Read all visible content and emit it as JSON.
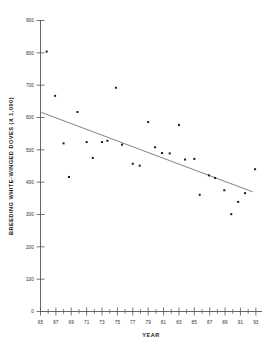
{
  "chart_data": {
    "type": "scatter",
    "title": "",
    "xlabel": "YEAR",
    "ylabel": "BREEDING WHITE-WINGED DOVES (X 1,000)",
    "xlim": [
      65,
      93.8
    ],
    "ylim": [
      0,
      900
    ],
    "grid": false,
    "legend": null,
    "x_tick_labels": [
      "65",
      "67",
      "69",
      "71",
      "73",
      "75",
      "77",
      "79",
      "81",
      "83",
      "85",
      "87",
      "89",
      "91",
      "93"
    ],
    "x_tick_values": [
      65,
      67,
      69,
      71,
      73,
      75,
      77,
      79,
      81,
      83,
      85,
      87,
      89,
      91,
      93
    ],
    "x_minor_tick_values": [
      66,
      68,
      70,
      72,
      74,
      76,
      78,
      80,
      82,
      84,
      86,
      88,
      90,
      92
    ],
    "y_tick_labels": [
      "0",
      "100",
      "200",
      "300",
      "400",
      "500",
      "600",
      "700",
      "800",
      "900"
    ],
    "y_tick_values": [
      0,
      100,
      200,
      300,
      400,
      500,
      600,
      700,
      800,
      900
    ],
    "points": [
      {
        "x": 65.8,
        "y": 804
      },
      {
        "x": 66.9,
        "y": 667
      },
      {
        "x": 68.0,
        "y": 520
      },
      {
        "x": 68.7,
        "y": 416
      },
      {
        "x": 69.8,
        "y": 617
      },
      {
        "x": 71.0,
        "y": 524
      },
      {
        "x": 71.8,
        "y": 475
      },
      {
        "x": 73.0,
        "y": 524
      },
      {
        "x": 73.7,
        "y": 528
      },
      {
        "x": 74.8,
        "y": 692
      },
      {
        "x": 75.6,
        "y": 516
      },
      {
        "x": 77.0,
        "y": 457
      },
      {
        "x": 77.9,
        "y": 451
      },
      {
        "x": 79.0,
        "y": 586
      },
      {
        "x": 79.9,
        "y": 508
      },
      {
        "x": 80.8,
        "y": 490
      },
      {
        "x": 81.8,
        "y": 489
      },
      {
        "x": 83.0,
        "y": 577
      },
      {
        "x": 83.8,
        "y": 470
      },
      {
        "x": 85.0,
        "y": 472
      },
      {
        "x": 85.7,
        "y": 361
      },
      {
        "x": 86.9,
        "y": 421
      },
      {
        "x": 87.7,
        "y": 413
      },
      {
        "x": 88.9,
        "y": 375
      },
      {
        "x": 89.8,
        "y": 301
      },
      {
        "x": 90.7,
        "y": 339
      },
      {
        "x": 91.6,
        "y": 366
      },
      {
        "x": 92.9,
        "y": 440
      }
    ],
    "trend_line": {
      "x_start": 65.1,
      "y_start": 616,
      "x_end": 92.6,
      "y_end": 370
    },
    "colors": {
      "marker": "#1c1c1c",
      "trend": "#6a6a6a",
      "axis": "#555555",
      "background": "#ffffff",
      "text": "#1a1a1a"
    }
  }
}
